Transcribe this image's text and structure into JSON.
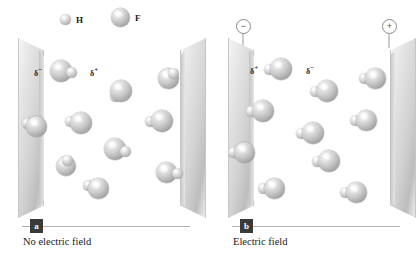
{
  "legend": {
    "items": [
      {
        "label": "H",
        "icon": "small-sphere",
        "size": 11
      },
      {
        "label": "F",
        "icon": "large-sphere",
        "size": 19
      }
    ]
  },
  "panels": [
    {
      "id": "a",
      "tag": "a",
      "caption": "No electric field",
      "delta_left": "δ",
      "delta_left_sign": "−",
      "delta_right": "δ",
      "delta_right_sign": "+",
      "terminals": [],
      "molecule_count": 10,
      "molecules": [
        {
          "x": 32,
          "y": 22,
          "f": 22,
          "h": 11,
          "angle": 18
        },
        {
          "x": 92,
          "y": 42,
          "f": 22,
          "h": 11,
          "angle": 118
        },
        {
          "x": 140,
          "y": 30,
          "f": 21,
          "h": 11,
          "angle": 300
        },
        {
          "x": 8,
          "y": 78,
          "f": 21,
          "h": 11,
          "angle": 210
        },
        {
          "x": 52,
          "y": 74,
          "f": 22,
          "h": 11,
          "angle": 196
        },
        {
          "x": 133,
          "y": 72,
          "f": 22,
          "h": 11,
          "angle": 172
        },
        {
          "x": 86,
          "y": 100,
          "f": 22,
          "h": 11,
          "angle": 22
        },
        {
          "x": 38,
          "y": 118,
          "f": 20,
          "h": 11,
          "angle": 276
        },
        {
          "x": 70,
          "y": 140,
          "f": 21,
          "h": 11,
          "angle": 208
        },
        {
          "x": 138,
          "y": 124,
          "f": 21,
          "h": 11,
          "angle": 8
        }
      ]
    },
    {
      "id": "b",
      "tag": "b",
      "caption": "Electric field",
      "delta_left": "δ",
      "delta_left_sign": "+",
      "delta_right": "δ",
      "delta_right_sign": "−",
      "terminals": [
        {
          "name": "negative-terminal",
          "sign": "−",
          "side": "left"
        },
        {
          "name": "positive-terminal",
          "sign": "+",
          "side": "right"
        }
      ],
      "molecule_count": 10,
      "molecules": [
        {
          "x": 42,
          "y": 20,
          "f": 22,
          "h": 11,
          "angle": 180
        },
        {
          "x": 88,
          "y": 42,
          "f": 22,
          "h": 11,
          "angle": 180
        },
        {
          "x": 137,
          "y": 30,
          "f": 21,
          "h": 11,
          "angle": 180
        },
        {
          "x": 24,
          "y": 62,
          "f": 22,
          "h": 11,
          "angle": 180
        },
        {
          "x": 128,
          "y": 72,
          "f": 21,
          "h": 11,
          "angle": 180
        },
        {
          "x": 74,
          "y": 84,
          "f": 22,
          "h": 11,
          "angle": 180
        },
        {
          "x": 6,
          "y": 104,
          "f": 21,
          "h": 11,
          "angle": 180
        },
        {
          "x": 90,
          "y": 112,
          "f": 22,
          "h": 11,
          "angle": 180
        },
        {
          "x": 36,
          "y": 140,
          "f": 21,
          "h": 11,
          "angle": 180
        },
        {
          "x": 118,
          "y": 144,
          "f": 21,
          "h": 11,
          "angle": 180
        }
      ]
    }
  ],
  "colors": {
    "plate": "#d2d2d2",
    "sphere": "#bfbfbf",
    "text": "#1a1a1a",
    "tag_bg": "#3a3a3a",
    "rule": "#b4b4b4"
  }
}
